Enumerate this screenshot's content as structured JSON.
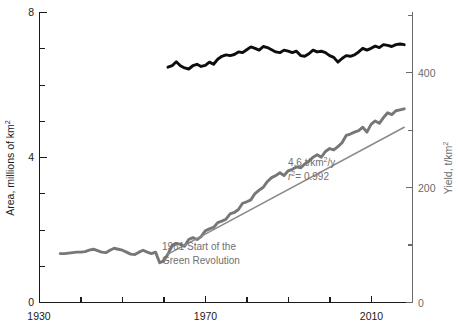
{
  "chart_data": {
    "type": "line",
    "title": "",
    "subtitle": "",
    "grid": false,
    "legend_position": "none",
    "xlabel": "",
    "xlim": [
      1930,
      2020
    ],
    "x_ticks_major": [
      1930,
      1970,
      2010
    ],
    "x_tick_labels": [
      "1930",
      "1970",
      "2010"
    ],
    "x_ticks_minor": [
      1940,
      1950,
      1960,
      1980,
      1990,
      2000
    ],
    "axes": {
      "left": {
        "label_prefix": "Area, millions of km",
        "label_sup": "2",
        "label_full": "Area, millions of km2",
        "ylim": [
          0,
          8
        ],
        "ticks_major": [
          0,
          4,
          8
        ],
        "tick_labels": [
          "0",
          "4",
          "8"
        ],
        "ticks_minor": [
          1,
          2,
          3,
          5,
          6,
          7
        ],
        "color": "#1a1a1a"
      },
      "right": {
        "label_prefix": "Yield, t/km",
        "label_sup": "2",
        "label_full": "Yield, t/km2",
        "ylim": [
          0,
          600
        ],
        "ticks_major": [
          0,
          200,
          400
        ],
        "tick_labels": [
          "0",
          "200",
          "400"
        ],
        "ticks_minor": [
          100,
          300,
          500
        ],
        "color": "#6b6b6b"
      }
    },
    "annotations": [
      {
        "name": "green-revolution-note",
        "line1": "1961 Start of the",
        "line2": "Green Revolution",
        "color": "#6f6f6f"
      },
      {
        "name": "regression-note",
        "slope_text_prefix": "4.6 t/km",
        "slope_text_sup": "2",
        "slope_text_suffix": "/y",
        "slope_full": "4.6 t/km2/y",
        "r2_symbol": "r",
        "r2_sup": "2",
        "r2_value": "= 0.992",
        "r2_full": "r2 = 0.992",
        "color": "#6f6f6f"
      }
    ],
    "series": [
      {
        "name": "Area",
        "axis": "left",
        "color": "#0d0d0d",
        "units": "millions of km^2",
        "x": [
          1961,
          1962,
          1963,
          1964,
          1965,
          1966,
          1967,
          1968,
          1969,
          1970,
          1971,
          1972,
          1973,
          1974,
          1975,
          1976,
          1977,
          1978,
          1979,
          1980,
          1981,
          1982,
          1983,
          1984,
          1985,
          1986,
          1987,
          1988,
          1989,
          1990,
          1991,
          1992,
          1993,
          1994,
          1995,
          1996,
          1997,
          1998,
          1999,
          2000,
          2001,
          2002,
          2003,
          2004,
          2005,
          2006,
          2007,
          2008,
          2009,
          2010,
          2011,
          2012,
          2013,
          2014,
          2015,
          2016,
          2017,
          2018
        ],
        "values": [
          6.48,
          6.52,
          6.63,
          6.52,
          6.46,
          6.43,
          6.52,
          6.56,
          6.5,
          6.53,
          6.62,
          6.56,
          6.7,
          6.78,
          6.82,
          6.8,
          6.83,
          6.9,
          6.88,
          6.96,
          7.04,
          7.0,
          6.95,
          7.05,
          7.02,
          6.96,
          6.9,
          6.88,
          6.95,
          6.92,
          6.88,
          6.92,
          6.8,
          6.78,
          6.85,
          6.95,
          6.9,
          6.92,
          6.88,
          6.8,
          6.75,
          6.62,
          6.72,
          6.8,
          6.78,
          6.82,
          6.9,
          7.0,
          6.95,
          7.0,
          7.06,
          7.02,
          7.1,
          7.08,
          7.05,
          7.1,
          7.12,
          7.1
        ]
      },
      {
        "name": "Yield",
        "axis": "right",
        "color": "#777777",
        "units": "t/km^2",
        "x": [
          1935,
          1936,
          1937,
          1938,
          1939,
          1940,
          1941,
          1942,
          1943,
          1944,
          1945,
          1946,
          1947,
          1948,
          1949,
          1950,
          1951,
          1952,
          1953,
          1954,
          1955,
          1956,
          1957,
          1958,
          1959,
          1960,
          1961,
          1962,
          1963,
          1964,
          1965,
          1966,
          1967,
          1968,
          1969,
          1970,
          1971,
          1972,
          1973,
          1974,
          1975,
          1976,
          1977,
          1978,
          1979,
          1980,
          1981,
          1982,
          1983,
          1984,
          1985,
          1986,
          1987,
          1988,
          1989,
          1990,
          1991,
          1992,
          1993,
          1994,
          1995,
          1996,
          1997,
          1998,
          1999,
          2000,
          2001,
          2002,
          2003,
          2004,
          2005,
          2006,
          2007,
          2008,
          2009,
          2010,
          2011,
          2012,
          2013,
          2014,
          2015,
          2016,
          2017,
          2018
        ],
        "values": [
          101,
          101,
          102,
          103,
          104,
          104,
          105,
          108,
          110,
          107,
          104,
          103,
          108,
          112,
          110,
          108,
          104,
          100,
          99,
          104,
          108,
          104,
          101,
          104,
          82,
          86,
          100,
          118,
          122,
          120,
          116,
          130,
          134,
          130,
          136,
          148,
          152,
          155,
          165,
          168,
          172,
          183,
          186,
          192,
          205,
          208,
          212,
          225,
          232,
          238,
          250,
          258,
          262,
          268,
          262,
          272,
          275,
          280,
          278,
          286,
          292,
          300,
          305,
          300,
          312,
          318,
          315,
          322,
          330,
          345,
          348,
          352,
          355,
          362,
          352,
          368,
          375,
          370,
          382,
          392,
          388,
          396,
          398,
          400
        ]
      }
    ],
    "trendline": {
      "name": "Yield linear fit",
      "axis": "right",
      "color": "#8a8a8a",
      "slope_per_year": 4.6,
      "r_squared": 0.992,
      "x_range": [
        1961,
        2018
      ],
      "y_range": [
        100,
        362
      ]
    }
  }
}
